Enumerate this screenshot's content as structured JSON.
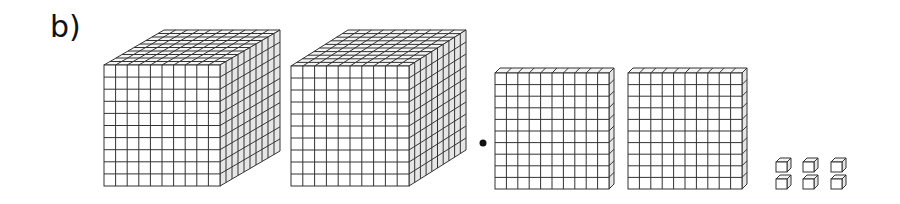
{
  "label": "b)",
  "blocks": {
    "cubes_of_thousand": 2,
    "flats_of_hundred": 2,
    "unit_cubes": 6
  },
  "separator": "dot",
  "colors": {
    "line": "#333333",
    "front_fill": "#ffffff",
    "top_fill": "#f4f4f4",
    "side_fill": "#e6e6e6"
  }
}
